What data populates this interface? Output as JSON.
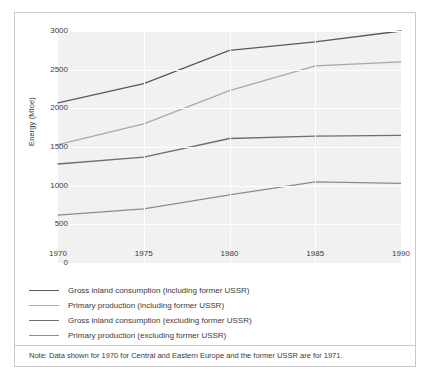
{
  "chart_data": {
    "type": "line",
    "title": "",
    "xlabel": "",
    "ylabel": "Energy (Mtoe)",
    "x": [
      1970,
      1975,
      1980,
      1985,
      1990
    ],
    "xtick_labels": [
      "1970",
      "1975",
      "1980",
      "1985",
      "1990"
    ],
    "ytick_labels": [
      "0",
      "500",
      "1000",
      "1500",
      "2000",
      "2500",
      "3000"
    ],
    "ylim": [
      0,
      3000
    ],
    "xlim": [
      1970,
      1990
    ],
    "grid": true,
    "legend_position": "below-plot",
    "series": [
      {
        "name": "Gross inland consumption (including former USSR)",
        "color": "#595959",
        "values": [
          2070,
          2320,
          2750,
          2860,
          3000
        ]
      },
      {
        "name": "Primary production (including former USSR)",
        "color": "#a8a8a8",
        "values": [
          1530,
          1800,
          2230,
          2550,
          2600
        ]
      },
      {
        "name": "Gross inland consumption (excluding former USSR)",
        "color": "#6e6e6e",
        "values": [
          1280,
          1370,
          1610,
          1640,
          1650
        ]
      },
      {
        "name": "Primary production (excluding former USSR)",
        "color": "#8c8c8c",
        "values": [
          620,
          700,
          880,
          1050,
          1030
        ]
      }
    ],
    "note": "Note: Data shown for 1970 for Central and Eastern Europe and the former USSR are for 1971."
  },
  "colors": {
    "plot_background": "#f1f1f1",
    "gridline": "#ffffff",
    "border": "#c9c9c9",
    "text": "#3a3a3a"
  }
}
